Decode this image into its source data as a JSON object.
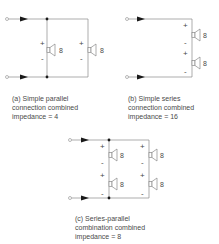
{
  "diagrams": [
    {
      "id": "a",
      "caption_lines": [
        "(a) Simple parallel",
        "connection combined",
        "impedance = 4"
      ],
      "speakers": [
        {
          "impedance": "8",
          "plus": "+",
          "minus": "-"
        },
        {
          "impedance": "8",
          "plus": "+",
          "minus": "-"
        }
      ]
    },
    {
      "id": "b",
      "caption_lines": [
        "(b) Simple series",
        "connection combined",
        "impedance = 16"
      ],
      "speakers": [
        {
          "impedance": "8",
          "plus": "+",
          "minus": "-"
        },
        {
          "impedance": "8",
          "plus": "+",
          "minus": "-"
        }
      ]
    },
    {
      "id": "c",
      "caption_lines": [
        "(c) Series-parallel",
        "combination combined",
        "impedance = 8"
      ],
      "speakers": [
        {
          "impedance": "8",
          "plus": "+",
          "minus": "-"
        },
        {
          "impedance": "8",
          "plus": "+",
          "minus": "-"
        },
        {
          "impedance": "8",
          "plus": "+",
          "minus": "-"
        },
        {
          "impedance": "8",
          "plus": "+",
          "minus": "-"
        }
      ]
    }
  ],
  "colors": {
    "wire": "#8a8a8a",
    "arrow": "#1a1a1a",
    "dot": "#1a1a1a",
    "speaker": "#8a8a8a",
    "text": "#4a4a4a"
  }
}
